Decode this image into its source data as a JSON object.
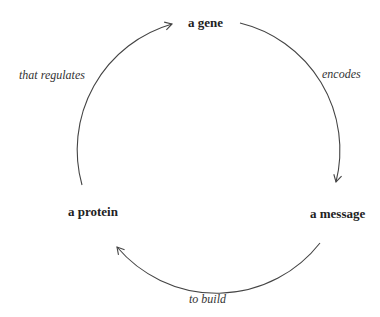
{
  "nodes": {
    "top": "a gene",
    "right": "a message",
    "left": "a protein"
  },
  "edges": {
    "top_right": "encodes",
    "bottom": "to build",
    "left": "that regulates"
  },
  "colors": {
    "line": "#444444",
    "text": "#222222"
  }
}
